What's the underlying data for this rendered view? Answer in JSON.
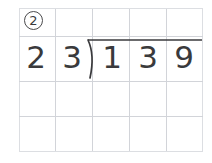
{
  "worksheet": {
    "problem_number": "②",
    "problem_number_plain": "2",
    "expression": "139 ÷ 23",
    "divisor": {
      "value": "23",
      "digits": [
        "2",
        "3"
      ]
    },
    "dividend": {
      "value": "139",
      "digits": [
        "1",
        "3",
        "9"
      ]
    },
    "quotient": {
      "value": "",
      "digits": [
        "",
        "",
        ""
      ]
    },
    "symbols": {
      "division_bracket": "long-division-bracket",
      "vinculum": "overbar"
    },
    "grid": {
      "columns": 5,
      "rows": 4,
      "empty_work_rows": 2
    },
    "colors": {
      "ink": "#3a3a3c",
      "grid_line": "#d6d8dd",
      "grid_edge": "#dcdee2",
      "background": "#ffffff"
    }
  }
}
